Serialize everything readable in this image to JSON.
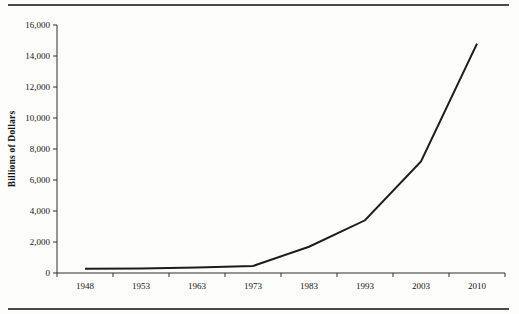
{
  "figure": {
    "background": "#fdfdfc",
    "rule_color": "#4a4a4a"
  },
  "chart_data": {
    "type": "line",
    "title": "",
    "xlabel": "",
    "ylabel": "Billions of Dollars",
    "categories": [
      "1948",
      "1953",
      "1963",
      "1973",
      "1983",
      "1993",
      "2003",
      "2010"
    ],
    "values": [
      270,
      300,
      360,
      450,
      1700,
      3400,
      7200,
      14800
    ],
    "series_name": "dollars",
    "ylim": [
      0,
      16000
    ],
    "ytick_interval": 2000,
    "ytick_labels": [
      "0",
      "2,000",
      "4,000",
      "6,000",
      "8,000",
      "10,000",
      "12,000",
      "14,000",
      "16,000"
    ],
    "grid": false,
    "legend": "none",
    "line_color": "#1c1c1c",
    "axis_color": "#2e2e2e",
    "text_color": "#141414"
  }
}
